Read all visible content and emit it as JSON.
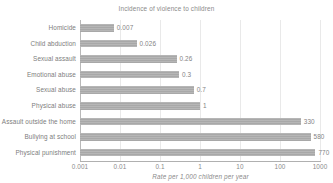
{
  "chart_data": {
    "type": "bar",
    "orientation": "horizontal",
    "title": "Incidence of violence to children",
    "xlabel": "Rate per 1,000 children per year",
    "ylabel": "",
    "xscale": "log",
    "xlim": [
      0.001,
      1000
    ],
    "grid": true,
    "legend": "none",
    "xticks": [
      "0.001",
      "0.01",
      "0.1",
      "1",
      "10",
      "100",
      "1000"
    ],
    "xtick_values": [
      0.001,
      0.01,
      0.1,
      1,
      10,
      100,
      1000
    ],
    "bar_color": "#a8a8a8",
    "categories": [
      "Homicide",
      "Child abduction",
      "Sexual assault",
      "Emotional abuse",
      "Sexual abuse",
      "Physical abuse",
      "Assault outside the home",
      "Bullying at school",
      "Physical punishment"
    ],
    "values": [
      0.007,
      0.026,
      0.26,
      0.3,
      0.7,
      1,
      330,
      580,
      770
    ],
    "data_labels": [
      "0.007",
      "0.026",
      "0.26",
      "0.3",
      "0.7",
      "1",
      "330",
      "580",
      "770"
    ]
  }
}
